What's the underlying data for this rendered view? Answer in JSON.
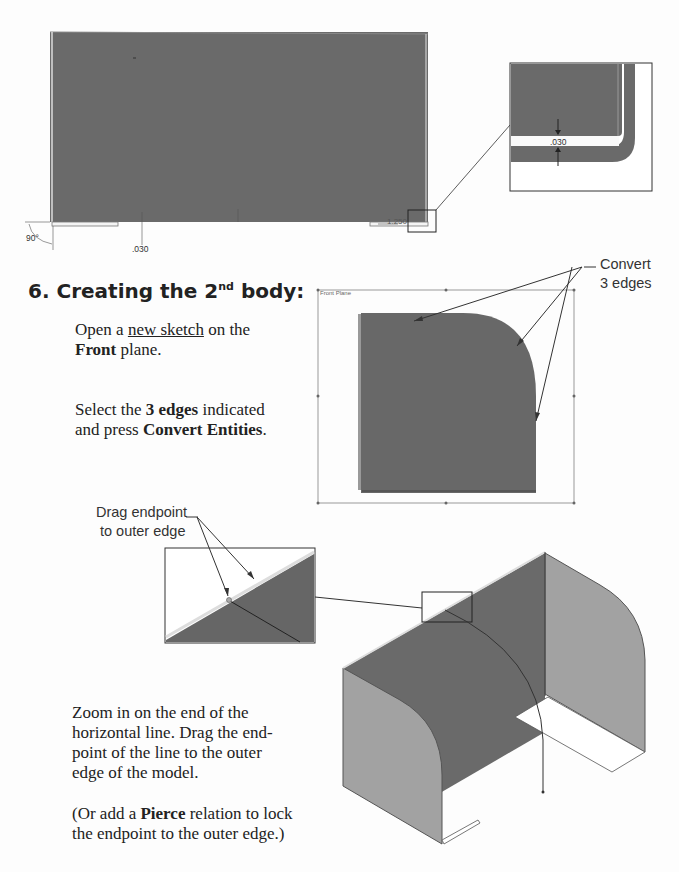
{
  "top_figure": {
    "dimensions": {
      "angle": "90°",
      "thickness": ".030",
      "length": "1.250",
      "zoom_detail_thickness": ".030"
    }
  },
  "step": {
    "number": "6.",
    "title_before": "Creating the 2",
    "title_sup": "nd",
    "title_after": " body:"
  },
  "instructions": {
    "p1_before": "Open a ",
    "p1_link": "new sketch",
    "p1_after": " on the",
    "p1_bold": "Front",
    "p1_end": " plane.",
    "p2_before": "Select the ",
    "p2_bold1": "3 edges",
    "p2_mid": " indicated",
    "p2_line2": "and press ",
    "p2_bold2": "Convert Entities",
    "p2_end": ".",
    "p3": "Zoom in on the end of the horizontal line. Drag the end-point of the line to the outer edge of the model.",
    "p3_l1": "Zoom in on the end of the",
    "p3_l2": "horizontal line. Drag the end-",
    "p3_l3": "point of the line to the outer",
    "p3_l4": "edge of the model.",
    "p4_before": "(Or add a ",
    "p4_bold": "Pierce",
    "p4_after": " relation to lock",
    "p4_l2": "the endpoint to the outer edge.)"
  },
  "callouts": {
    "convert_l1": "Convert",
    "convert_l2": "3 edges",
    "drag_l1": "Drag endpoint",
    "drag_l2": "to outer edge"
  },
  "sketch_plane_label": "Front Plane",
  "colors": {
    "face_dark": "#666666",
    "face_light": "#a0a0a0",
    "face_mid": "#7a7a7a",
    "outline": "#333333"
  }
}
